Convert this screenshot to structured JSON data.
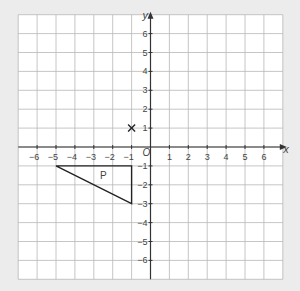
{
  "colors": {
    "background": "#ececec",
    "panel": "#ffffff",
    "grid_line": "#b8b8b8",
    "axis": "#333333",
    "shape": "#222222",
    "text": "#444444"
  },
  "chart_data": {
    "type": "coordinate-grid",
    "xlabel": "x",
    "ylabel": "y",
    "origin_label": "O",
    "xlim": [
      -7,
      7
    ],
    "ylim": [
      -7,
      7
    ],
    "x_ticks": [
      -6,
      -5,
      -4,
      -3,
      -2,
      -1,
      1,
      2,
      3,
      4,
      5,
      6
    ],
    "y_ticks": [
      -6,
      -5,
      -4,
      -3,
      -2,
      -1,
      1,
      2,
      3,
      4,
      5,
      6
    ],
    "grid": true,
    "shapes": [
      {
        "name": "P",
        "type": "triangle",
        "vertices": [
          [
            -5,
            -1
          ],
          [
            -1,
            -1
          ],
          [
            -1,
            -3
          ]
        ],
        "label": "P",
        "label_position": [
          -2.5,
          -1.5
        ]
      }
    ],
    "points": [
      {
        "marker": "x",
        "coords": [
          -1,
          1
        ]
      }
    ]
  }
}
